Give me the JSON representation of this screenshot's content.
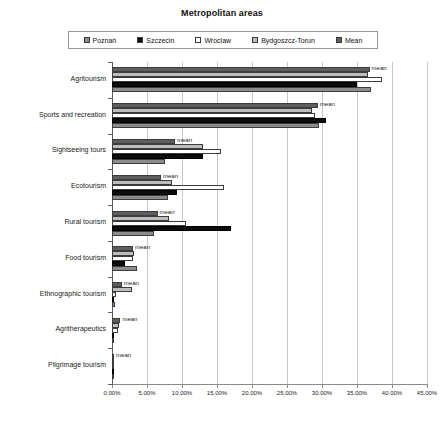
{
  "title": "Metropolitan areas",
  "legend": {
    "position": "top",
    "items": [
      {
        "label": "Poznań",
        "color": "#8c8c8c",
        "key": "poznan"
      },
      {
        "label": "Szczecin",
        "color": "#0d0d0d",
        "key": "szczecin"
      },
      {
        "label": "Wroclaw",
        "color": "#ffffff",
        "key": "wroclaw"
      },
      {
        "label": "Bydgoszcz-Torun",
        "color": "#bdbdbd",
        "key": "bydgoszcz"
      },
      {
        "label": "Mean",
        "color": "#5e5e5e",
        "key": "mean"
      }
    ]
  },
  "axis": {
    "x_ticks": [
      "0.00%",
      "5.00%",
      "10.00%",
      "15.00%",
      "20.00%",
      "25.00%",
      "30.00%",
      "35.00%",
      "40.00%",
      "45.00%"
    ],
    "x_min": 0,
    "x_max": 45,
    "x_step": 5,
    "mean_annotation": "mean"
  },
  "chart_data": {
    "type": "bar",
    "orientation": "horizontal",
    "title": "Metropolitan areas",
    "xlabel": "",
    "ylabel": "",
    "xlim": [
      0,
      45
    ],
    "grid": true,
    "legend_position": "top",
    "categories": [
      "Agritourism",
      "Sports and recreation",
      "Sightseeing tours",
      "Ecotourism",
      "Rural tourism",
      "Food tourism",
      "Ethnographic tourism",
      "Agritherapeutics",
      "Pilgrimage tourism"
    ],
    "series": [
      {
        "name": "Poznań",
        "color": "#8c8c8c",
        "values": [
          37.0,
          29.5,
          7.5,
          8.0,
          6.0,
          3.5,
          0.4,
          0.0,
          0.2
        ]
      },
      {
        "name": "Szczecin",
        "color": "#0d0d0d",
        "values": [
          35.0,
          30.5,
          13.0,
          9.3,
          17.0,
          1.8,
          0.3,
          0.0,
          0.0
        ]
      },
      {
        "name": "Wroclaw",
        "color": "#ffffff",
        "values": [
          38.5,
          29.0,
          15.5,
          16.0,
          10.5,
          3.0,
          0.6,
          0.9,
          0.0
        ]
      },
      {
        "name": "Bydgoszcz-Torun",
        "color": "#bdbdbd",
        "values": [
          36.5,
          28.5,
          13.0,
          8.5,
          8.2,
          3.2,
          2.8,
          1.0,
          0.0
        ]
      },
      {
        "name": "Mean",
        "color": "#5e5e5e",
        "values": [
          36.8,
          29.4,
          9.0,
          7.0,
          6.5,
          3.0,
          1.4,
          1.2,
          0.3
        ]
      }
    ]
  }
}
